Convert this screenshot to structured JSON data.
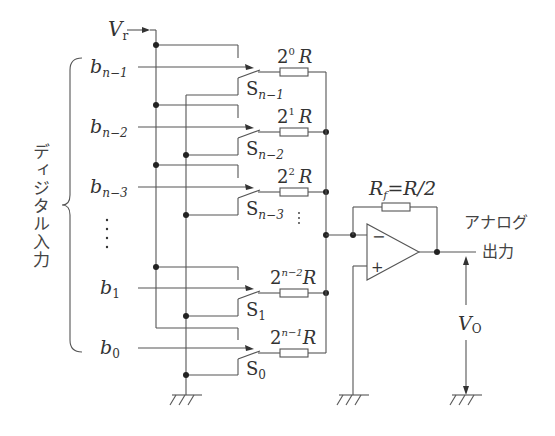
{
  "diagram": {
    "reference_label": {
      "main": "V",
      "sub": "r"
    },
    "input_group_label": "ディジタル入力",
    "inputs": [
      {
        "bit": "b",
        "sub": "n−1",
        "switch": "S",
        "switch_sub": "n−1",
        "resistor_base": "2",
        "resistor_exp": "0",
        "resistor_unit": "R"
      },
      {
        "bit": "b",
        "sub": "n−2",
        "switch": "S",
        "switch_sub": "n−2",
        "resistor_base": "2",
        "resistor_exp": "1",
        "resistor_unit": "R"
      },
      {
        "bit": "b",
        "sub": "n−3",
        "switch": "S",
        "switch_sub": "n−3",
        "resistor_base": "2",
        "resistor_exp": "2",
        "resistor_unit": "R"
      },
      {
        "bit": "b",
        "sub": "1",
        "switch": "S",
        "switch_sub": "1",
        "resistor_base": "2",
        "resistor_exp": "n−2",
        "resistor_unit": "R"
      },
      {
        "bit": "b",
        "sub": "0",
        "switch": "S",
        "switch_sub": "0",
        "resistor_base": "2",
        "resistor_exp": "n−1",
        "resistor_unit": "R"
      }
    ],
    "ellipsis": "⋮",
    "feedback": {
      "label_main": "R",
      "label_sub": "f",
      "label_rest": "=R/2"
    },
    "opamp": {
      "minus": "−",
      "plus": "+"
    },
    "output_label_line1": "アナログ",
    "output_label_line2": "出力",
    "output_voltage": {
      "main": "V",
      "sub": "O"
    }
  }
}
